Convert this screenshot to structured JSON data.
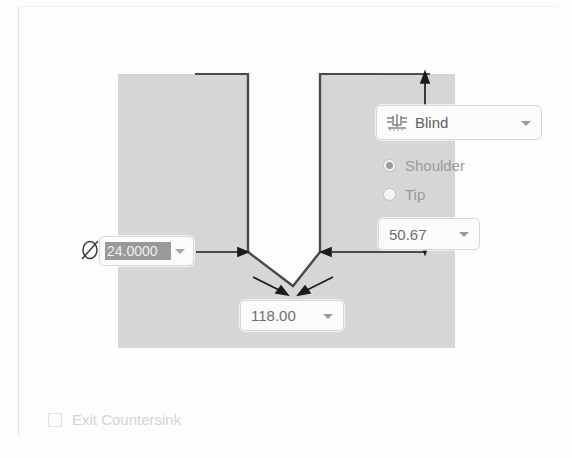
{
  "panel": {
    "title": "Hole Specification Preview"
  },
  "end_condition": {
    "icon": "blind-hole-icon",
    "value": "Blind",
    "caret": "chevron-down-icon"
  },
  "depth_reference": {
    "options": [
      {
        "label": "Shoulder",
        "selected": true
      },
      {
        "label": "Tip",
        "selected": false
      }
    ]
  },
  "depth": {
    "value": "50.67",
    "caret": "chevron-down-icon"
  },
  "diameter": {
    "symbol": "diameter-symbol",
    "value": "24.0000",
    "selected": true,
    "caret": "chevron-down-icon"
  },
  "angle": {
    "value": "118.00",
    "caret": "chevron-down-icon"
  },
  "exit_countersink": {
    "label": "Exit Countersink",
    "checked": false,
    "enabled": false
  },
  "colors": {
    "material_fill": "#d6d6d6",
    "outline": "#4a4a4a",
    "dimension": "#1c1c1c",
    "panel_background": "#fdfdfd",
    "field_border": "#d8d8d8",
    "selection_highlight": "#9a9a9a",
    "disabled_text": "#d4d4d4"
  },
  "drawing": {
    "description": "Cross-section of a blind drilled hole in material",
    "annotations": [
      "diameter-dimension-arrows",
      "depth-dimension-arrows",
      "drill-point-angle-leaders"
    ]
  }
}
